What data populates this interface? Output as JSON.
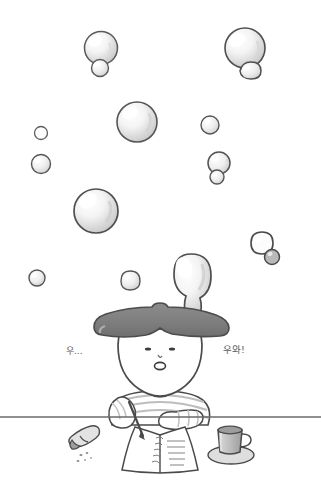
{
  "scene": {
    "title": "Bubble daydream illustration",
    "width": 321,
    "height": 485,
    "background_color": "#ffffff"
  },
  "palette": {
    "background": "#ffffff",
    "ink_outline": "#4a4a4a",
    "ink_soft": "#6e6e6e",
    "hair_fill": "#808080",
    "hair_outline": "#4d4d4d",
    "bubble_fill": "#fdfdfd",
    "bubble_shade": "#c9c9c9",
    "bubble_outline": "#595959",
    "desk_line": "#6a6a6a",
    "skin_fill": "#ffffff",
    "shirt_stripe": "#bdbdbd",
    "mug_fill": "#c6c6c6",
    "mug_dark": "#8f8f8f",
    "eraser_fill": "#d8d8d8",
    "text_color": "#5a5a5a"
  },
  "sound_effects": [
    {
      "id": "left",
      "text": "우...",
      "x": 66,
      "y": 347,
      "meaning": "uu..."
    },
    {
      "id": "right",
      "text": "우와!",
      "x": 223,
      "y": 345,
      "meaning": "wow!"
    }
  ],
  "bubbles": [
    {
      "id": "b01",
      "cx": 101,
      "cy": 48,
      "r": 16.5,
      "role": "large-top-left-pair-main"
    },
    {
      "id": "b02",
      "cx": 100,
      "cy": 68,
      "r": 8.5,
      "role": "large-top-left-pair-small"
    },
    {
      "id": "b03",
      "cx": 245,
      "cy": 48,
      "r": 20,
      "role": "large-top-right-main"
    },
    {
      "id": "b04",
      "cx": 249,
      "cy": 73,
      "r": 10,
      "role": "large-top-right-small"
    },
    {
      "id": "b05",
      "cx": 137,
      "cy": 122,
      "r": 20,
      "role": "center-large"
    },
    {
      "id": "b06",
      "cx": 210,
      "cy": 125,
      "r": 9,
      "role": "mid-right-small"
    },
    {
      "id": "b07",
      "cx": 41,
      "cy": 133,
      "r": 6.5,
      "role": "left-tiny"
    },
    {
      "id": "b08",
      "cx": 41,
      "cy": 164,
      "r": 9.5,
      "role": "left-small"
    },
    {
      "id": "b09",
      "cx": 219,
      "cy": 163,
      "r": 11,
      "role": "right-pair-main"
    },
    {
      "id": "b10",
      "cx": 217,
      "cy": 177,
      "r": 7,
      "role": "right-pair-small"
    },
    {
      "id": "b11",
      "cx": 96,
      "cy": 211,
      "r": 22,
      "role": "lower-left-large"
    },
    {
      "id": "b12",
      "cx": 262,
      "cy": 243,
      "r": 11,
      "role": "lower-right-pair-main"
    },
    {
      "id": "b13",
      "cx": 272,
      "cy": 257,
      "r": 7.5,
      "role": "lower-right-pair-small"
    },
    {
      "id": "b14",
      "cx": 37,
      "cy": 278,
      "r": 8,
      "role": "bottom-left-small"
    },
    {
      "id": "b15",
      "cx": 130,
      "cy": 281,
      "r": 9.5,
      "role": "bottom-center-small"
    },
    {
      "id": "b16",
      "cx": 189,
      "cy": 281,
      "r": 22,
      "role": "head-emerging-big"
    }
  ],
  "character": {
    "name": "kid-at-desk",
    "face": {
      "eyes": [
        "left-eye-dot",
        "right-eye-dot"
      ],
      "nose": "tiny-nose",
      "mouth": "open-o-mouth",
      "expression": "amazed"
    },
    "hair": "bowl-cut-gray",
    "shirt": "striped-long-sleeve",
    "pose": "writing-in-notebook"
  },
  "desk": {
    "line_y": 417,
    "items": [
      {
        "id": "eraser",
        "label": "eraser-with-crumbs",
        "x": 80,
        "y": 443
      },
      {
        "id": "notebook",
        "label": "open-notebook",
        "x": 155,
        "y": 448
      },
      {
        "id": "pencil",
        "label": "pencil",
        "x": 134,
        "y": 418
      },
      {
        "id": "mug",
        "label": "mug-on-coaster",
        "x": 228,
        "y": 443
      }
    ]
  }
}
